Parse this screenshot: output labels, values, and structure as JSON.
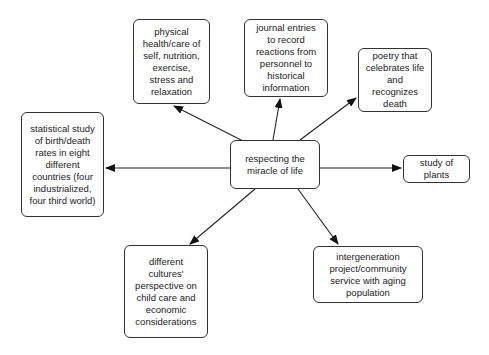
{
  "diagram": {
    "center": {
      "label": "respecting the\nmiracle of life"
    },
    "nodes": [
      {
        "id": "physical",
        "label": "physical\nhealth/care of\nself, nutrition,\nexercise,\nstress and\nrelaxation"
      },
      {
        "id": "journal",
        "label": "journal entries\nto record\nreactions from\npersonnel to\nhistorical\ninformation"
      },
      {
        "id": "poetry",
        "label": "poetry that\ncelebrates life\nand recognizes\ndeath"
      },
      {
        "id": "statistical",
        "label": "statistical study\nof birth/death\nrates in eight\ndifferent\ncountries (four\nindustrialized,\nfour third world)"
      },
      {
        "id": "plants",
        "label": "study of plants"
      },
      {
        "id": "cultures",
        "label": "different\ncultures'\nperspective on\nchild care and\neconomic\nconsiderations"
      },
      {
        "id": "intergeneration",
        "label": "intergeneration\nproject/community\nservice with aging\npopulation"
      }
    ],
    "edges": [
      {
        "from": "center",
        "to": "physical"
      },
      {
        "from": "center",
        "to": "journal"
      },
      {
        "from": "center",
        "to": "poetry"
      },
      {
        "from": "center",
        "to": "statistical"
      },
      {
        "from": "center",
        "to": "plants"
      },
      {
        "from": "center",
        "to": "cultures"
      },
      {
        "from": "center",
        "to": "intergeneration"
      }
    ],
    "colors": {
      "line": "#222222",
      "border": "#333333",
      "text": "#222222",
      "background": "#ffffff"
    }
  }
}
